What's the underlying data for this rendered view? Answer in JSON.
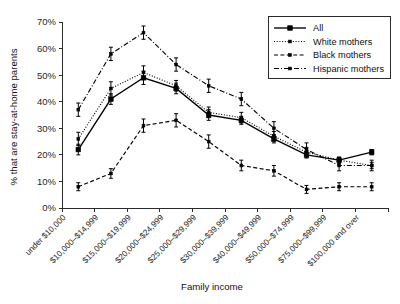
{
  "chart_data": {
    "type": "line",
    "title": "",
    "xlabel": "Family income",
    "ylabel": "% that are stay-at-home parents",
    "ylim": [
      0,
      70
    ],
    "ytick_labels": [
      "0%",
      "10%",
      "20%",
      "30%",
      "40%",
      "50%",
      "60%",
      "70%"
    ],
    "ytick_values": [
      0,
      10,
      20,
      30,
      40,
      50,
      60,
      70
    ],
    "grid": false,
    "legend_position": "top-right",
    "categories": [
      "under $10,000",
      "$10,000–$14,999",
      "$15,000–$19,999",
      "$20,000–$24,999",
      "$25,000–$29,999",
      "$30,000–$39,999",
      "$40,000–$49,999",
      "$50,000–$74,999",
      "$75,000–$99,999",
      "$100,000 and over"
    ],
    "series": [
      {
        "name": "All",
        "style": "solid",
        "marker": "square",
        "values": [
          22,
          41,
          49,
          45,
          35,
          33,
          26,
          20,
          18,
          21
        ],
        "errors": [
          2.0,
          2.0,
          2.5,
          2.0,
          2.0,
          1.5,
          1.5,
          1.2,
          1.0,
          1.0
        ]
      },
      {
        "name": "White mothers",
        "style": "dotted",
        "marker": "square",
        "values": [
          26,
          45,
          51,
          46,
          36,
          34,
          27,
          21,
          18,
          16
        ],
        "errors": [
          2.5,
          2.5,
          2.5,
          2.0,
          2.0,
          2.0,
          1.8,
          1.8,
          1.2,
          1.2
        ]
      },
      {
        "name": "Black mothers",
        "style": "dashed",
        "marker": "square",
        "values": [
          8,
          13,
          31,
          33,
          25,
          16,
          14,
          7,
          8,
          8
        ],
        "errors": [
          1.5,
          1.8,
          2.5,
          2.5,
          2.5,
          2.0,
          2.0,
          1.5,
          1.5,
          1.5
        ]
      },
      {
        "name": "Hispanic mothers",
        "style": "dashdot",
        "marker": "square",
        "values": [
          37,
          58,
          66,
          54,
          46,
          41,
          30,
          22,
          16,
          16
        ],
        "errors": [
          2.5,
          2.5,
          2.5,
          2.5,
          2.5,
          2.5,
          2.5,
          2.5,
          2.0,
          2.0
        ]
      }
    ]
  },
  "legend": {
    "entries": [
      {
        "label": "All"
      },
      {
        "label": "White mothers"
      },
      {
        "label": "Black mothers"
      },
      {
        "label": "Hispanic mothers"
      }
    ]
  },
  "colors": {
    "line": "#000000",
    "axis": "#2b2b2b",
    "background": "#ffffff",
    "text": "#111111"
  }
}
